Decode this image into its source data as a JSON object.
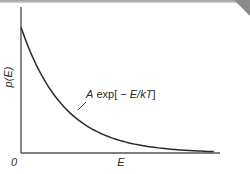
{
  "figure": {
    "ylabel": "p(E)",
    "xlabel": "E",
    "origin_label": "0",
    "curve_label": {
      "prefix": "A",
      "func": " exp[",
      "minus": " − ",
      "arg": "E/kT",
      "suffix": "]"
    },
    "colors": {
      "ink": "#2a2a2a",
      "axis": "#555555",
      "corner": "#8c8c8c"
    }
  },
  "chart_data": {
    "type": "line",
    "title": "",
    "xlabel": "E",
    "ylabel": "p(E)",
    "series": [
      {
        "name": "A exp[-E/kT]",
        "function": "A*exp(-E/kT)",
        "x": [
          0,
          0.5,
          1,
          1.5,
          2,
          2.5,
          3,
          3.5,
          4,
          4.5,
          5,
          5.5,
          6,
          6.5,
          7,
          7.5,
          8,
          8.5,
          9
        ],
        "y": [
          1.0,
          0.7788,
          0.6065,
          0.4724,
          0.3679,
          0.2865,
          0.2231,
          0.1738,
          0.1353,
          0.1054,
          0.0821,
          0.0639,
          0.0498,
          0.0388,
          0.0302,
          0.0235,
          0.0183,
          0.0143,
          0.0111
        ]
      }
    ],
    "xlim": [
      0,
      9.8
    ],
    "ylim": [
      0,
      1.16
    ],
    "ticks": {
      "x": [
        "0"
      ],
      "y": []
    },
    "grid": false,
    "legend": "none"
  }
}
